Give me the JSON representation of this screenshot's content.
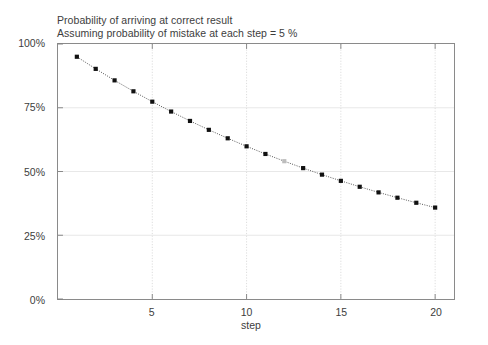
{
  "chart_data": {
    "type": "scatter",
    "title": "Probability of arriving at correct result",
    "subtitle": "Assuming probability of mistake at each step = 5 %",
    "xlabel": "step",
    "ylabel": "",
    "xlim": [
      0,
      21
    ],
    "ylim": [
      0,
      1
    ],
    "grid": true,
    "legend": "none",
    "marker": "square",
    "marker_color": "#111111",
    "line_style": "dotted",
    "line_color": "#555555",
    "x_ticks": [
      5,
      10,
      15,
      20
    ],
    "x_tick_labels": [
      "5",
      "10",
      "15",
      "20"
    ],
    "y_ticks": [
      0,
      0.25,
      0.5,
      0.75,
      1.0
    ],
    "y_tick_labels": [
      "0%",
      "25%",
      "50%",
      "75%",
      "100%"
    ],
    "x": [
      1,
      2,
      3,
      4,
      5,
      6,
      7,
      8,
      9,
      10,
      11,
      12,
      13,
      14,
      15,
      16,
      17,
      18,
      19,
      20
    ],
    "values": [
      0.95,
      0.9025,
      0.8574,
      0.8145,
      0.7738,
      0.7351,
      0.6983,
      0.6634,
      0.6302,
      0.5987,
      0.5688,
      0.5404,
      0.5133,
      0.4877,
      0.4633,
      0.4401,
      0.4181,
      0.3972,
      0.3774,
      0.3585
    ],
    "value_labels": [
      "95%",
      "90%",
      "86%",
      "81%",
      "77%",
      "74%",
      "70%",
      "66%",
      "63%",
      "60%",
      "57%",
      "54%",
      "51%",
      "49%",
      "46%",
      "44%",
      "42%",
      "40%",
      "38%",
      "36%"
    ],
    "faded_point_index": 11
  },
  "axis": {
    "x_title": "step"
  }
}
